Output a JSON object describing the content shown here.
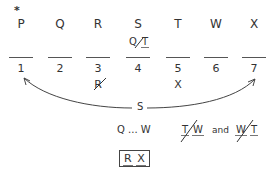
{
  "diagram": {
    "marker": "*",
    "letters": [
      "P",
      "Q",
      "R",
      "S",
      "T",
      "W",
      "X"
    ],
    "slot_numbers": [
      "1",
      "2",
      "3",
      "4",
      "5",
      "6",
      "7"
    ],
    "slot4_annotation": {
      "left": "Q",
      "right": "T",
      "crossed": true
    },
    "slot3_excluded": "R",
    "slot5_excluded": "X",
    "arrow_label": "S",
    "rules": {
      "sequence": {
        "start": "Q",
        "ellipsis": "...",
        "end": "W"
      },
      "pair1": {
        "left": "T",
        "right": "W",
        "crossed": true
      },
      "connector": "and",
      "pair2": {
        "left": "W",
        "right": "T",
        "crossed": true
      },
      "block": [
        "R",
        "X"
      ]
    }
  }
}
